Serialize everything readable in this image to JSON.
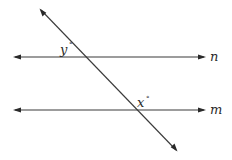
{
  "diagram": {
    "type": "parallel lines cut by a transversal",
    "lines": [
      {
        "id": "n",
        "label": "n",
        "kind": "parallel-line",
        "arrows": "both"
      },
      {
        "id": "m",
        "label": "m",
        "kind": "parallel-line",
        "arrows": "both"
      },
      {
        "id": "t",
        "label": "",
        "kind": "transversal",
        "arrows": "both"
      }
    ],
    "angles": [
      {
        "id": "y",
        "variable": "y",
        "symbol": "°",
        "at": "intersection of transversal and line n",
        "position": "upper-left"
      },
      {
        "id": "x",
        "variable": "x",
        "symbol": "°",
        "at": "intersection of transversal and line m",
        "position": "upper-right"
      }
    ],
    "colors": {
      "stroke": "#3a3a3a",
      "text": "#2a2a2a",
      "background": "#ffffff"
    }
  }
}
